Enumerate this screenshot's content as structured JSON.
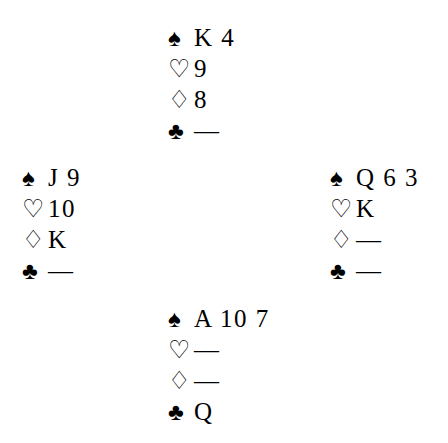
{
  "diagram": {
    "type": "bridge-deal",
    "background_color": "#ffffff",
    "text_color": "#000000",
    "void_symbol": "—",
    "suits": {
      "spade": {
        "glyph": "♠",
        "name": "spade-symbol",
        "style": "filled"
      },
      "heart": {
        "glyph": "♡",
        "name": "heart-symbol",
        "style": "hollow"
      },
      "diamond": {
        "glyph": "♢",
        "name": "diamond-symbol",
        "style": "hollow"
      },
      "club": {
        "glyph": "♣",
        "name": "club-symbol",
        "style": "filled"
      }
    }
  },
  "hands": {
    "north": {
      "position": "north",
      "spades": "K 4",
      "hearts": "9",
      "diamonds": "8",
      "clubs": "—"
    },
    "west": {
      "position": "west",
      "spades": "J 9",
      "hearts": "10",
      "diamonds": "K",
      "clubs": "—"
    },
    "east": {
      "position": "east",
      "spades": "Q 6 3",
      "hearts": "K",
      "diamonds": "—",
      "clubs": "—"
    },
    "south": {
      "position": "south",
      "spades": "A 10 7",
      "hearts": "—",
      "diamonds": "—",
      "clubs": "Q"
    }
  }
}
